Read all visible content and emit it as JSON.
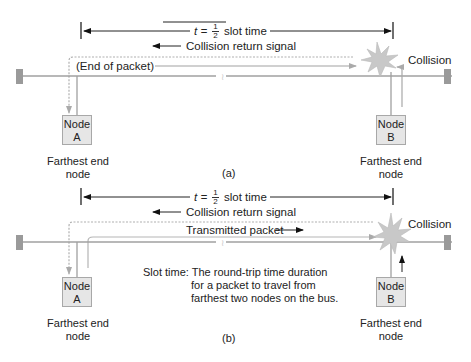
{
  "diagram": {
    "panels": [
      {
        "id": "a",
        "sub_label": "(a)",
        "t_label_prefix": "t = ",
        "t_fraction_num": "1",
        "t_fraction_den": "2",
        "t_label_suffix": " slot time",
        "return_label": "Collision return signal",
        "packet_label": "(End of packet)",
        "collision_label": "Collision",
        "node_a": {
          "line1": "Node",
          "line2": "A",
          "caption_line1": "Farthest end",
          "caption_line2": "node"
        },
        "node_b": {
          "line1": "Node",
          "line2": "B",
          "caption_line1": "Farthest end",
          "caption_line2": "node"
        }
      },
      {
        "id": "b",
        "sub_label": "(b)",
        "t_label_prefix": "t = ",
        "t_fraction_num": "1",
        "t_fraction_den": "2",
        "t_label_suffix": " slot time",
        "return_label": "Collision return signal",
        "packet_label": "Transmitted packet",
        "collision_label": "Collision",
        "slot_time_term": "Slot time:",
        "slot_time_def_1": "The round-trip time duration",
        "slot_time_def_2": "for a packet to travel from",
        "slot_time_def_3": "farthest two nodes on the bus.",
        "node_a": {
          "line1": "Node",
          "line2": "A",
          "caption_line1": "Farthest end",
          "caption_line2": "node"
        },
        "node_b": {
          "line1": "Node",
          "line2": "B",
          "caption_line1": "Farthest end",
          "caption_line2": "node"
        }
      }
    ]
  },
  "colors": {
    "bus_line": "#a0a0a0",
    "terminator": "#9a9a9a",
    "signal_line": "#b8b8b8",
    "collision_burst": "#c8c8c8",
    "text": "#222222"
  }
}
